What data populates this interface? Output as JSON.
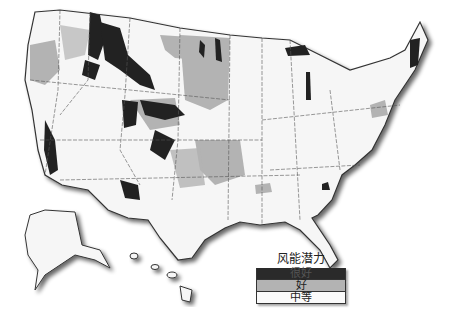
{
  "map": {
    "subject": "United States wind energy potential",
    "colors": {
      "very_good": "#2a2a2a",
      "good": "#b0b0b0",
      "moderate": "#f4f4f4",
      "border": "#555555"
    }
  },
  "legend": {
    "title": "风能潜力",
    "items": [
      {
        "label": "很好",
        "color": "#2a2a2a",
        "text_color": "#444"
      },
      {
        "label": "好",
        "color": "#b3b3b3",
        "text_color": "#222"
      },
      {
        "label": "中等",
        "color": "#fafafa",
        "text_color": "#222"
      }
    ]
  }
}
